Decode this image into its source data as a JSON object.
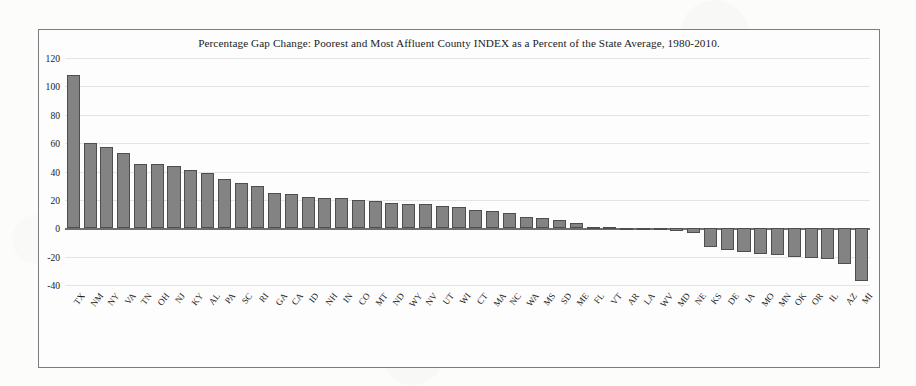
{
  "chart_data": {
    "type": "bar",
    "title": "Percentage Gap Change: Poorest and Most Affluent County INDEX as a Percent of the State Average, 1980-2010.",
    "xlabel": "",
    "ylabel": "",
    "ylim": [
      -40,
      120
    ],
    "yticks": [
      120,
      100,
      80,
      60,
      40,
      20,
      0,
      -20,
      -40
    ],
    "grid": true,
    "legend": "none",
    "bar_color": "#838383",
    "bar_edge_color": "#4e4e4e",
    "categories": [
      "TX",
      "NM",
      "NY",
      "VA",
      "TN",
      "OH",
      "NJ",
      "KY",
      "AL",
      "PA",
      "SC",
      "RI",
      "GA",
      "CA",
      "ID",
      "NH",
      "IN",
      "CO",
      "MT",
      "ND",
      "WY",
      "NV",
      "UT",
      "WI",
      "CT",
      "MA",
      "NC",
      "WA",
      "MS",
      "SD",
      "ME",
      "FL",
      "VT",
      "AR",
      "LA",
      "WV",
      "MD",
      "NE",
      "KS",
      "DE",
      "IA",
      "MO",
      "MN",
      "OK",
      "OR",
      "IL",
      "AZ",
      "MI"
    ],
    "values": [
      108,
      60,
      57,
      53,
      45,
      45,
      44,
      41,
      39,
      35,
      32,
      30,
      25,
      24,
      22,
      21,
      21,
      20,
      19,
      18,
      17,
      17,
      16,
      15,
      13,
      12,
      11,
      8,
      7,
      6,
      4,
      1,
      1,
      -1,
      -1,
      -1,
      -2,
      -3,
      -13,
      -15,
      -17,
      -18,
      -19,
      -20,
      -21,
      -22,
      -25,
      -37
    ]
  }
}
